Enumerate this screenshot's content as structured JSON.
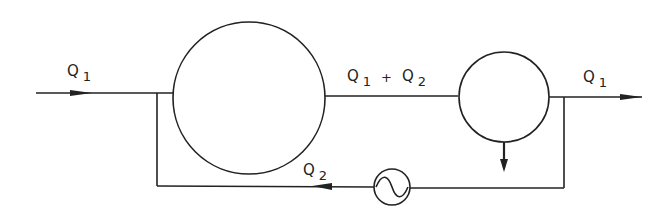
{
  "diagram": {
    "type": "flow-schematic",
    "labels": {
      "inlet": {
        "main": "Q",
        "sub": "1"
      },
      "middle": {
        "main1": "Q",
        "sub1": "1",
        "plus": "+",
        "main2": "Q",
        "sub2": "2"
      },
      "outlet": {
        "main": "Q",
        "sub": "1"
      },
      "recycle": {
        "main": "Q",
        "sub": "2"
      }
    },
    "components": [
      {
        "id": "large-vessel",
        "shape": "circle"
      },
      {
        "id": "small-vessel",
        "shape": "circle",
        "has_bottom_outlet_arrow": true
      },
      {
        "id": "pump",
        "shape": "circle-with-sine"
      }
    ],
    "colors": {
      "line": "#222222",
      "background": "#ffffff"
    }
  }
}
